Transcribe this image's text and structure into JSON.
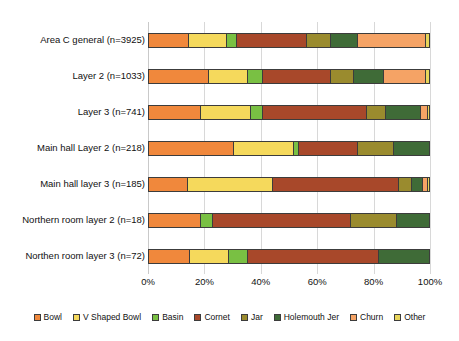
{
  "chart_data": {
    "type": "bar",
    "subtype": "stacked-horizontal-100-percent",
    "title": "",
    "xlabel": "",
    "ylabel": "",
    "xlim": [
      0,
      100
    ],
    "xticks": [
      "0%",
      "20%",
      "40%",
      "60%",
      "80%",
      "100%"
    ],
    "xtick_values": [
      0,
      20,
      40,
      60,
      80,
      100
    ],
    "grid": true,
    "grid_axis": "x",
    "legend_position": "bottom",
    "categories": [
      "Area C general (n=3925)",
      "Layer 2 (n=1033)",
      "Layer 3 (n=741)",
      "Main hall Layer 2 (n=218)",
      "Main hall layer 3 (n=185)",
      "Northern room layer 2 (n=18)",
      "Northen room layer 3 (n=72)"
    ],
    "series": [
      {
        "name": "Bowl",
        "color": "#F0883C",
        "values": [
          14.2,
          21.3,
          18.4,
          30.5,
          13.9,
          18.4,
          14.5
        ]
      },
      {
        "name": "V Shaped Bowl",
        "color": "#F5D95C",
        "values": [
          13.5,
          14.2,
          18.1,
          21.3,
          30.4,
          0.0,
          14.2
        ]
      },
      {
        "name": "Basin",
        "color": "#79C043",
        "values": [
          3.9,
          5.3,
          4.3,
          1.7,
          0.0,
          4.6,
          6.7
        ]
      },
      {
        "name": "Cornet",
        "color": "#A8482A",
        "values": [
          24.8,
          24.1,
          37.2,
          21.0,
          45.1,
          49.3,
          46.6
        ]
      },
      {
        "name": "Jar",
        "color": "#9A8B2E",
        "values": [
          8.5,
          8.5,
          6.8,
          13.1,
          4.6,
          16.4,
          0.0
        ]
      },
      {
        "name": "Holemouth Jer",
        "color": "#3F6B37",
        "values": [
          9.6,
          10.6,
          12.4,
          12.4,
          3.9,
          11.3,
          18.0
        ]
      },
      {
        "name": "Churn",
        "color": "#F5A365",
        "values": [
          24.5,
          14.9,
          2.5,
          0.0,
          1.6,
          0.0,
          0.0
        ]
      },
      {
        "name": "Other",
        "color": "#E8D55A",
        "values": [
          1.0,
          1.1,
          0.3,
          0.0,
          0.5,
          0.0,
          0.0
        ]
      }
    ],
    "legend": [
      {
        "label": "Bowl",
        "color": "#F0883C"
      },
      {
        "label": "V Shaped Bowl",
        "color": "#F5D95C"
      },
      {
        "label": "Basin",
        "color": "#79C043"
      },
      {
        "label": "Cornet",
        "color": "#A8482A"
      },
      {
        "label": "Jar",
        "color": "#9A8B2E"
      },
      {
        "label": "Holemouth Jer",
        "color": "#3F6B37"
      },
      {
        "label": "Churn",
        "color": "#F5A365"
      },
      {
        "label": "Other",
        "color": "#E8D55A"
      }
    ]
  }
}
